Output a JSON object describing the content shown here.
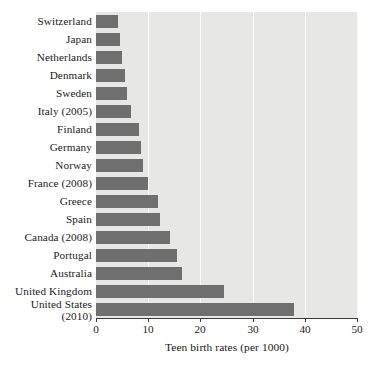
{
  "chart_data": {
    "type": "bar",
    "orientation": "horizontal",
    "title": "",
    "xlabel": "Teen birth rates (per 1000)",
    "ylabel": "",
    "xlim": [
      0,
      50
    ],
    "xticks": [
      0,
      10,
      20,
      30,
      40,
      50
    ],
    "grid": true,
    "legend": null,
    "bar_color": "#6f6f6f",
    "plot_background": "#e7e7e5",
    "categories": [
      "Switzerland",
      "Japan",
      "Netherlands",
      "Denmark",
      "Sweden",
      "Italy (2005)",
      "Finland",
      "Germany",
      "Norway",
      "France (2008)",
      "Greece",
      "Spain",
      "Canada (2008)",
      "Portugal",
      "Australia",
      "United Kingdom",
      "United States (2010)"
    ],
    "values": [
      4.3,
      4.6,
      4.9,
      5.5,
      5.9,
      6.7,
      8.3,
      8.6,
      9.0,
      10.0,
      11.8,
      12.2,
      14.1,
      15.6,
      16.5,
      24.5,
      37.9
    ],
    "value_unit": "births per 1000"
  },
  "axis": {
    "x_title": "Teen birth rates (per 1000)",
    "tick_labels": [
      "0",
      "10",
      "20",
      "30",
      "40",
      "50"
    ]
  },
  "category_labels": [
    {
      "main": "Switzerland",
      "sub": ""
    },
    {
      "main": "Japan",
      "sub": ""
    },
    {
      "main": "Netherlands",
      "sub": ""
    },
    {
      "main": "Denmark",
      "sub": ""
    },
    {
      "main": "Sweden",
      "sub": ""
    },
    {
      "main": "Italy (2005)",
      "sub": ""
    },
    {
      "main": "Finland",
      "sub": ""
    },
    {
      "main": "Germany",
      "sub": ""
    },
    {
      "main": "Norway",
      "sub": ""
    },
    {
      "main": "France (2008)",
      "sub": ""
    },
    {
      "main": "Greece",
      "sub": ""
    },
    {
      "main": "Spain",
      "sub": ""
    },
    {
      "main": "Canada (2008)",
      "sub": ""
    },
    {
      "main": "Portugal",
      "sub": ""
    },
    {
      "main": "Australia",
      "sub": ""
    },
    {
      "main": "United Kingdom",
      "sub": ""
    },
    {
      "main": "United States",
      "sub": "(2010)"
    }
  ]
}
